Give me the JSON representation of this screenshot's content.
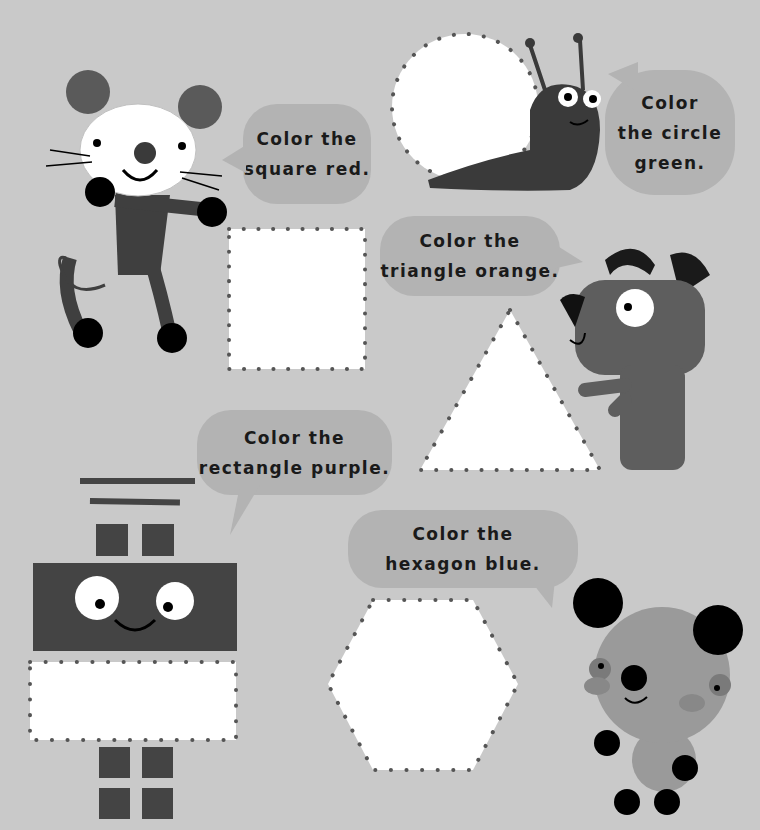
{
  "page": {
    "background_color": "#c9c9c9",
    "bubble_color": "#b3b3b3",
    "dot_color": "#555555",
    "character_dark": "#4a4a4a"
  },
  "instructions": [
    {
      "id": "square",
      "lines": [
        "Color the",
        "square red."
      ],
      "shape": "square",
      "color_word": "red",
      "speaker": "mouse"
    },
    {
      "id": "circle",
      "lines": [
        "Color",
        "the circle",
        "green."
      ],
      "shape": "circle",
      "color_word": "green",
      "speaker": "snail"
    },
    {
      "id": "triangle",
      "lines": [
        "Color the",
        "triangle orange."
      ],
      "shape": "triangle",
      "color_word": "orange",
      "speaker": "dog"
    },
    {
      "id": "rectangle",
      "lines": [
        "Color the",
        "rectangle purple."
      ],
      "shape": "rectangle",
      "color_word": "purple",
      "speaker": "robot"
    },
    {
      "id": "hexagon",
      "lines": [
        "Color the",
        "hexagon blue."
      ],
      "shape": "hexagon",
      "color_word": "blue",
      "speaker": "bear"
    }
  ],
  "characters": [
    "mouse",
    "snail",
    "dog",
    "robot",
    "bear"
  ]
}
